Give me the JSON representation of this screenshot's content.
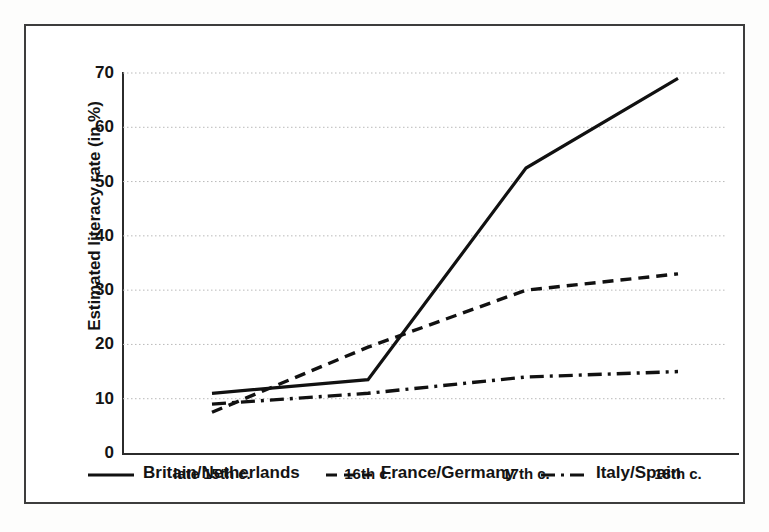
{
  "chart_data": {
    "type": "line",
    "title": "",
    "xlabel": "",
    "ylabel": "Estimated literacy rate (in %)",
    "categories": [
      "late 15th c.",
      "16th c.",
      "17th c.",
      "18th c."
    ],
    "ylim": [
      0,
      70
    ],
    "yticks": [
      0,
      10,
      20,
      30,
      40,
      50,
      60,
      70
    ],
    "grid": "horizontal-dotted",
    "legend_position": "bottom-center",
    "series": [
      {
        "name": "Britain/Netherlands",
        "style": "solid",
        "color": "#111111",
        "values": [
          11,
          13.5,
          52.5,
          69
        ]
      },
      {
        "name": "France/Germany",
        "style": "dashed",
        "color": "#111111",
        "values": [
          7.5,
          19.5,
          30,
          33
        ]
      },
      {
        "name": "Italy/Spain",
        "style": "dash-dot",
        "color": "#111111",
        "values": [
          9,
          11,
          14,
          15
        ]
      }
    ]
  },
  "axis": {
    "ytick_labels": [
      "0",
      "10",
      "20",
      "30",
      "40",
      "50",
      "60",
      "70"
    ]
  },
  "legend": {
    "items": [
      {
        "label": "Britain/Netherlands",
        "style": "solid"
      },
      {
        "label": "France/Germany",
        "style": "dashed"
      },
      {
        "label": "Italy/Spain",
        "style": "dash-dot"
      }
    ]
  }
}
